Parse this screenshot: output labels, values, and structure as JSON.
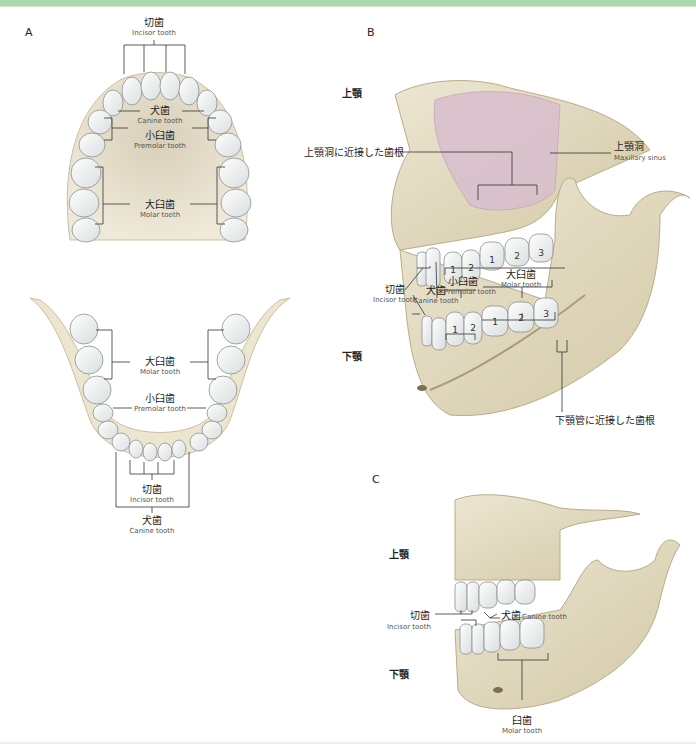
{
  "colors": {
    "top_bar": "#a9d8ac",
    "bone": "#e4dcc4",
    "bone_shadow": "#c9bd98",
    "tooth": "#f1f3f3",
    "tooth_outline": "#8a9090",
    "sinus": "#d9bfcf",
    "leader_line": "#333333"
  },
  "panels": {
    "A": {
      "letter": "A",
      "upper_arch": {
        "incisor": {
          "jp": "切歯",
          "en": "Incisor tooth"
        },
        "canine": {
          "jp": "犬歯",
          "en": "Canine tooth"
        },
        "premolar": {
          "jp": "小臼歯",
          "en": "Premolar tooth"
        },
        "molar": {
          "jp": "大臼歯",
          "en": "Molar tooth"
        }
      },
      "lower_arch": {
        "molar": {
          "jp": "大臼歯",
          "en": "Molar tooth"
        },
        "premolar": {
          "jp": "小臼歯",
          "en": "Premolar tooth"
        },
        "incisor": {
          "jp": "切歯",
          "en": "Incisor tooth"
        },
        "canine": {
          "jp": "犬歯",
          "en": "Canine tooth"
        }
      }
    },
    "B": {
      "letter": "B",
      "region_upper": "上顎",
      "region_lower": "下顎",
      "root_near_sinus": "上顎洞に近接した歯根",
      "maxillary_sinus": {
        "jp": "上顎洞",
        "en": "Maxillary sinus"
      },
      "incisor": {
        "jp": "切歯",
        "en": "Incisor tooth"
      },
      "canine": {
        "jp": "犬歯",
        "en": "Canine tooth"
      },
      "premolar": {
        "jp": "小臼歯",
        "en": "Premolar tooth"
      },
      "molar": {
        "jp": "大臼歯",
        "en": "Molar tooth"
      },
      "root_near_canal": "下顎管に近接した歯根",
      "upper_numbers": [
        "1",
        "2",
        "1",
        "2",
        "3"
      ],
      "lower_numbers": [
        "1",
        "2",
        "1",
        "2",
        "3"
      ]
    },
    "C": {
      "letter": "C",
      "region_upper": "上顎",
      "region_lower": "下顎",
      "incisor": {
        "jp": "切歯",
        "en": "Incisor tooth"
      },
      "canine": {
        "jp": "犬歯",
        "en": "Canine tooth"
      },
      "molar": {
        "jp": "臼歯",
        "en": "Molar tooth"
      }
    }
  }
}
